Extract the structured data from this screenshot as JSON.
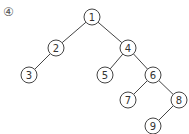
{
  "diagram": {
    "label": "④",
    "type": "binary-tree",
    "nodes": [
      {
        "id": "1",
        "x": 92,
        "y": 17
      },
      {
        "id": "2",
        "x": 56,
        "y": 48
      },
      {
        "id": "3",
        "x": 29,
        "y": 75
      },
      {
        "id": "4",
        "x": 128,
        "y": 48
      },
      {
        "id": "5",
        "x": 105,
        "y": 75
      },
      {
        "id": "6",
        "x": 153,
        "y": 75
      },
      {
        "id": "7",
        "x": 128,
        "y": 100
      },
      {
        "id": "8",
        "x": 179,
        "y": 100
      },
      {
        "id": "9",
        "x": 153,
        "y": 126
      }
    ],
    "edges": [
      [
        "1",
        "2"
      ],
      [
        "1",
        "4"
      ],
      [
        "2",
        "3"
      ],
      [
        "4",
        "5"
      ],
      [
        "4",
        "6"
      ],
      [
        "6",
        "7"
      ],
      [
        "6",
        "8"
      ],
      [
        "8",
        "9"
      ]
    ]
  }
}
